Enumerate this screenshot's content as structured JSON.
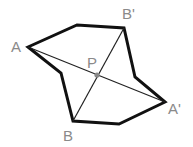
{
  "diagram": {
    "labels": {
      "A": "A",
      "A_prime": "A'",
      "B": "B",
      "B_prime": "B'",
      "P": "P"
    },
    "colors": {
      "outline": "#111111",
      "segment": "#222222",
      "label": "#8a8a8a",
      "point": "#888888",
      "background": "#ffffff"
    },
    "points": {
      "A": [
        28,
        47
      ],
      "top": [
        77,
        25
      ],
      "B_prime": [
        124,
        28
      ],
      "right_indent": [
        135,
        77
      ],
      "A_prime": [
        165,
        102
      ],
      "bottom_right": [
        119,
        124
      ],
      "B": [
        73,
        121
      ],
      "left_indent": [
        61,
        73
      ],
      "P": [
        97,
        75
      ]
    }
  }
}
